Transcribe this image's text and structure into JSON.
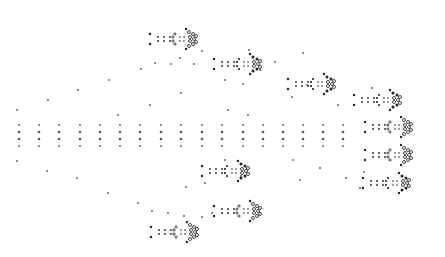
{
  "diagram": {
    "type": "dot-pattern",
    "width": 445,
    "height": 257,
    "colors": {
      "background": "#ffffff",
      "dot": "#555555",
      "dark": "#222222",
      "ring": "#333333"
    },
    "grid_columns_x": [
      19,
      39,
      59,
      80,
      100,
      120,
      140,
      161,
      181,
      202,
      222,
      243,
      263,
      283,
      303,
      323,
      343
    ],
    "grid_rows_y": [
      125,
      132,
      139,
      146
    ],
    "scatter_dots": [
      [
        17,
        110
      ],
      [
        48,
        100
      ],
      [
        78,
        90
      ],
      [
        109,
        80
      ],
      [
        141,
        69
      ],
      [
        155,
        63
      ],
      [
        171,
        64
      ],
      [
        180,
        58
      ],
      [
        194,
        64
      ],
      [
        202,
        51
      ],
      [
        181,
        93
      ],
      [
        150,
        105
      ],
      [
        118,
        115
      ],
      [
        17,
        161
      ],
      [
        47,
        171
      ],
      [
        77,
        178
      ],
      [
        108,
        193
      ],
      [
        138,
        203
      ],
      [
        152,
        211
      ],
      [
        168,
        213
      ],
      [
        184,
        216
      ],
      [
        202,
        217
      ],
      [
        212,
        213
      ],
      [
        225,
        80
      ],
      [
        243,
        84
      ],
      [
        260,
        70
      ],
      [
        275,
        62
      ],
      [
        303,
        53
      ],
      [
        307,
        85
      ],
      [
        292,
        97
      ],
      [
        249,
        50
      ],
      [
        228,
        110
      ],
      [
        248,
        115
      ],
      [
        338,
        105
      ],
      [
        372,
        88
      ],
      [
        225,
        160
      ],
      [
        241,
        176
      ],
      [
        186,
        187
      ],
      [
        205,
        183
      ],
      [
        293,
        160
      ],
      [
        300,
        180
      ],
      [
        320,
        168
      ],
      [
        346,
        178
      ],
      [
        364,
        172
      ],
      [
        360,
        188
      ]
    ],
    "clusters": [
      {
        "cx": 180,
        "cy": 39,
        "scale": 1.0,
        "filled": false
      },
      {
        "cx": 244,
        "cy": 64,
        "scale": 1.0,
        "filled": true
      },
      {
        "cx": 318,
        "cy": 84,
        "scale": 1.0,
        "filled": true
      },
      {
        "cx": 384,
        "cy": 100,
        "scale": 1.0,
        "filled": true
      },
      {
        "cx": 395,
        "cy": 127,
        "scale": 1.0,
        "filled": false
      },
      {
        "cx": 395,
        "cy": 155,
        "scale": 1.0,
        "filled": false
      },
      {
        "cx": 393,
        "cy": 183,
        "scale": 1.0,
        "filled": true
      },
      {
        "cx": 232,
        "cy": 171,
        "scale": 1.0,
        "filled": true
      },
      {
        "cx": 244,
        "cy": 211,
        "scale": 1.0,
        "filled": false
      },
      {
        "cx": 181,
        "cy": 232,
        "scale": 1.0,
        "filled": false
      }
    ]
  }
}
